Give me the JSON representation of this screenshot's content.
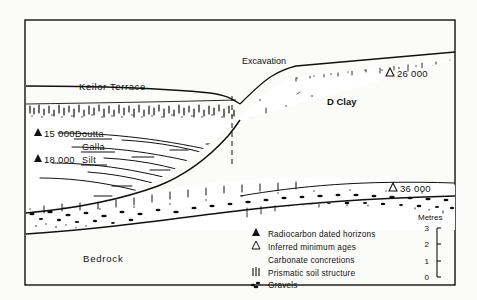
{
  "figure": {
    "kind": "geological-cross-section",
    "title_visible": false,
    "background_color": "#fbfbf9",
    "ink_color": "#111111"
  },
  "frame": {
    "x": 25,
    "y": 20,
    "width": 430,
    "height": 265
  },
  "annotations": {
    "keilor_terrace": "Keilor  Terrace",
    "excavation": "Excavation",
    "d_clay": "D Clay",
    "bedrock": "Bedrock",
    "doutta": "Doutta",
    "galla": "Galla",
    "silt": "Silt"
  },
  "dated_horizons": [
    {
      "symbol": "filled-triangle",
      "value": "15 000",
      "label": "▲15 000",
      "x": 34,
      "y": 134
    },
    {
      "symbol": "filled-triangle",
      "value": "18 000",
      "label": "▲18 000",
      "x": 34,
      "y": 160
    },
    {
      "symbol": "open-triangle",
      "value": "26 000",
      "label": "△ 26 000",
      "x": 388,
      "y": 74
    },
    {
      "symbol": "open-triangle",
      "value": "36 000",
      "label": "△36 000",
      "x": 393,
      "y": 189
    }
  ],
  "scale": {
    "caption": "Metres",
    "ticks": [
      "3",
      "2",
      "1",
      "0"
    ],
    "max": 3,
    "min": 0
  },
  "legend": {
    "items": [
      {
        "symbol": "filled-triangle",
        "label": "Radiocarbon dated horizons"
      },
      {
        "symbol": "open-triangle",
        "label": "Inferred minimum ages"
      },
      {
        "symbol": "none",
        "label": "Carbonate  concretions"
      },
      {
        "symbol": "prismatic-bars",
        "label": "Prismatic  soil  structure"
      },
      {
        "symbol": "gravel-cluster",
        "label": "Gravels"
      }
    ]
  }
}
